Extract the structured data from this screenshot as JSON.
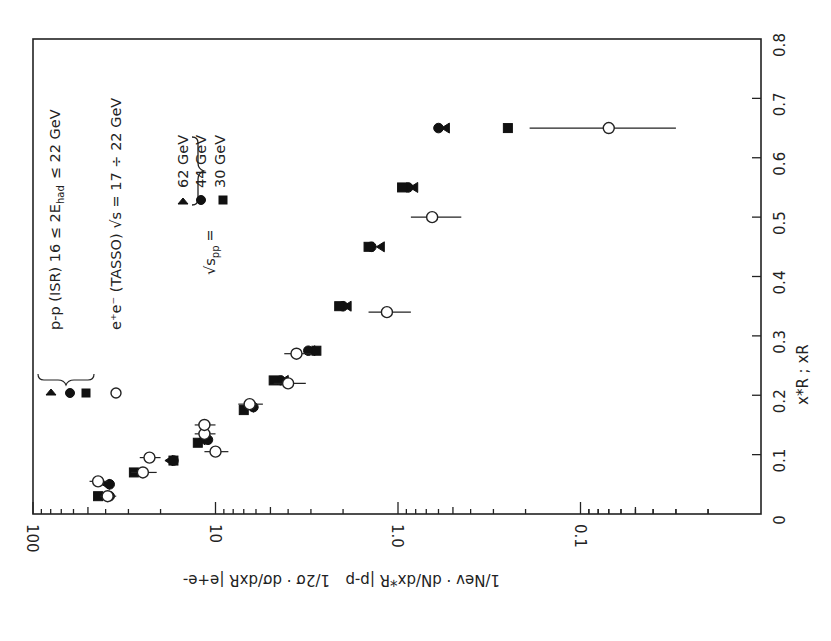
{
  "chart_data": {
    "type": "scatter",
    "title": "",
    "orientation_note": "figure printed rotated 90 degrees clockwise",
    "xlabel": "x*_R ; x_R",
    "ylabel": "(1/N_ev) dN/dx*_R |p-p ; (1/2σ) dσ/dx_R |e+e-",
    "xlim": [
      0,
      0.8
    ],
    "ylim": [
      0.01,
      100
    ],
    "yscale": "log",
    "x_ticks": [
      "0",
      "0.1",
      "0.2",
      "0.3",
      "0.4",
      "0.5",
      "0.6",
      "0.7",
      "0.8"
    ],
    "y_ticks": [
      "100",
      "10",
      "1.0",
      "0.1"
    ],
    "legend": {
      "pp_header": "p-p (ISR)  16 ≤ 2E_had ≤ 22 GeV",
      "ee_header": "e+e- (TASSO)  √s = 17 ÷ 22 GeV",
      "sqrt_s_label": "√s_pp =",
      "entries": [
        {
          "marker": "triangle",
          "label": "62 GeV"
        },
        {
          "marker": "circle-filled",
          "label": "44 GeV"
        },
        {
          "marker": "square",
          "label": "30 GeV"
        },
        {
          "marker": "circle-open",
          "label": "e+e- (TASSO)"
        }
      ]
    },
    "series": [
      {
        "name": "p-p √s=62 GeV",
        "marker": "triangle",
        "x": [
          0.05,
          0.09,
          0.125,
          0.18,
          0.225,
          0.275,
          0.35,
          0.45,
          0.55,
          0.65
        ],
        "y": [
          40,
          18,
          12,
          6.5,
          4.2,
          3.0,
          1.9,
          1.25,
          0.82,
          0.55
        ]
      },
      {
        "name": "p-p √s=44 GeV",
        "marker": "circle-filled",
        "x": [
          0.03,
          0.05,
          0.09,
          0.125,
          0.18,
          0.225,
          0.275,
          0.35,
          0.45,
          0.55,
          0.65
        ],
        "y": [
          38,
          38,
          17,
          11,
          6.2,
          4.4,
          3.1,
          2.0,
          1.4,
          0.88,
          0.6
        ]
      },
      {
        "name": "p-p √s=30 GeV",
        "marker": "square",
        "x": [
          0.03,
          0.07,
          0.09,
          0.12,
          0.175,
          0.225,
          0.275,
          0.35,
          0.45,
          0.55,
          0.65
        ],
        "y": [
          44,
          28,
          17,
          12.5,
          7.0,
          4.8,
          2.8,
          2.1,
          1.45,
          0.95,
          0.25
        ]
      },
      {
        "name": "e+e- TASSO",
        "marker": "circle-open",
        "x": [
          0.03,
          0.055,
          0.07,
          0.095,
          0.105,
          0.135,
          0.15,
          0.185,
          0.22,
          0.27,
          0.34,
          0.5,
          0.65
        ],
        "y": [
          39,
          44,
          25,
          23,
          10,
          11.5,
          11.5,
          6.5,
          4.0,
          3.6,
          1.15,
          0.65,
          0.07
        ],
        "xerr_note": "horizontal bars on plot are the vertical error bars of the rotated figure",
        "err_lo": [
          4,
          5,
          4,
          3,
          1.5,
          1.5,
          1.5,
          1,
          0.8,
          0.6,
          0.3,
          0.2,
          0.04
        ],
        "err_hi": [
          4,
          5,
          4,
          3,
          1.5,
          1.5,
          1.5,
          1,
          0.8,
          0.6,
          0.3,
          0.2,
          0.12
        ]
      }
    ]
  },
  "axes": {
    "x_tick_labels": [
      "0",
      "0.1",
      "0.2",
      "0.3",
      "0.4",
      "0.5",
      "0.6",
      "0.7",
      "0.8"
    ],
    "x_title": "x*R ; xR",
    "log_tick_labels": [
      "100",
      "10",
      "1.0",
      "0.1"
    ],
    "y_title_pp": "1/Nev · dN/dx*R |p-p",
    "y_title_ee": "1/2σ · dσ/dxR |e+e-"
  },
  "legend": {
    "pp_text": "p-p (ISR) 16 ≤ 2E",
    "pp_sub": "had",
    "pp_text_end": "≤ 22 GeV",
    "ee_text": "e⁺e⁻ (TASSO)  √s = 17 ÷ 22 GeV",
    "sqrt_label": "√s",
    "sqrt_sub": "pp",
    "sqrt_eq": "=",
    "e62": "62 GeV",
    "e44": "44 GeV",
    "e30": "30 GeV"
  }
}
